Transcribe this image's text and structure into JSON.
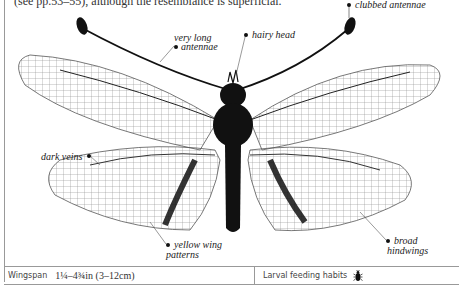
{
  "intro_text": "(see pp.53–55), although the resemblance is superficial.",
  "illustration": {
    "subject": "owlfly",
    "labels": [
      {
        "id": "clubbed-antennae",
        "text": "clubbed antennae"
      },
      {
        "id": "very-long-antennae",
        "line1": "very long",
        "line2": "antennae"
      },
      {
        "id": "hairy-head",
        "text": "hairy head"
      },
      {
        "id": "dark-veins",
        "text": "dark veins"
      },
      {
        "id": "yellow-wing-patterns",
        "line1": "yellow wing",
        "line2": "patterns"
      },
      {
        "id": "broad-hindwings",
        "line1": "broad",
        "line2": "hindwings"
      }
    ]
  },
  "info_bar": {
    "wingspan_label": "Wingspan",
    "wingspan_value": "1¼–4¾in (3–12cm)",
    "larval_label": "Larval feeding habits",
    "larval_icon": "beetle-icon"
  },
  "colors": {
    "rule": "#999999",
    "ink": "#111111",
    "text": "#222222"
  }
}
